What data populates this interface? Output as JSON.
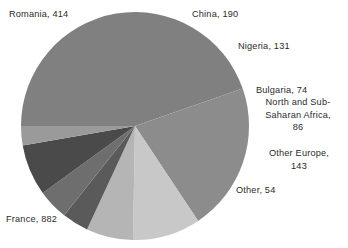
{
  "chart_data": {
    "type": "pie",
    "title": "",
    "subtitle": "",
    "xlabel": "",
    "ylabel": "",
    "legend_position": "none",
    "grid": false,
    "total": 1974,
    "start_angle_deg": 180,
    "direction": "clockwise",
    "categories": [
      "France",
      "Romania",
      "China",
      "Nigeria",
      "Bulgaria",
      "North and Sub-Saharan Africa",
      "Other Europe",
      "Other"
    ],
    "values": [
      882,
      414,
      190,
      131,
      74,
      86,
      143,
      54
    ],
    "slices": [
      {
        "name": "France",
        "label": "France, 882",
        "value": 882,
        "color": "#808080"
      },
      {
        "name": "Romania",
        "label": "Romania, 414",
        "value": 414,
        "color": "#8c8c8c"
      },
      {
        "name": "China",
        "label": "China, 190",
        "value": 190,
        "color": "#c8c8c8"
      },
      {
        "name": "Nigeria",
        "label": "Nigeria, 131",
        "value": 131,
        "color": "#b5b5b5"
      },
      {
        "name": "Bulgaria",
        "label": "Bulgaria, 74",
        "value": 74,
        "color": "#5a5a5a"
      },
      {
        "name": "North and Sub-Saharan Africa",
        "label": "North and Sub-\nSaharan Africa,\n86",
        "value": 86,
        "color": "#6e6e6e"
      },
      {
        "name": "Other Europe",
        "label": "Other Europe,\n143",
        "value": 143,
        "color": "#4a4a4a"
      },
      {
        "name": "Other",
        "label": "Other, 54",
        "value": 54,
        "color": "#9a9a9a"
      }
    ],
    "labels": {
      "romania": "Romania, 414",
      "france": "France, 882",
      "china": "China, 190",
      "nigeria": "Nigeria, 131",
      "bulgaria": "Bulgaria, 74",
      "north_sub_saharan_africa": "North and Sub-\nSaharan Africa,\n86",
      "other_europe": "Other Europe,\n143",
      "other": "Other, 54"
    },
    "geometry": {
      "center_x": 135,
      "center_y": 126,
      "radius": 114
    },
    "colors": {
      "background": "#ffffff",
      "text": "#2b2b2b"
    }
  }
}
